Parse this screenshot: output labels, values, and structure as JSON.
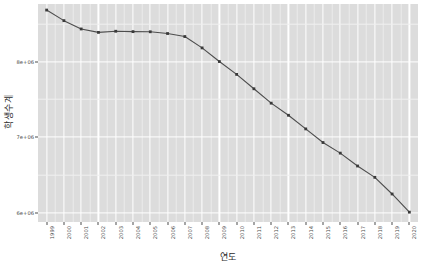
{
  "chart_data": {
    "type": "line",
    "title": "",
    "xlabel": "연도",
    "ylabel": "학생수계",
    "categories": [
      "1999",
      "2000",
      "2001",
      "2002",
      "2003",
      "2004",
      "2005",
      "2006",
      "2007",
      "2008",
      "2009",
      "2010",
      "2011",
      "2012",
      "2013",
      "2014",
      "2015",
      "2016",
      "2017",
      "2018",
      "2019",
      "2020"
    ],
    "values": [
      8680000,
      8540000,
      8430000,
      8385000,
      8400000,
      8395000,
      8393000,
      8370000,
      8330000,
      8180000,
      8000000,
      7830000,
      7640000,
      7450000,
      7290000,
      7110000,
      6930000,
      6790000,
      6620000,
      6470000,
      6250000,
      6010000
    ],
    "series": [
      {
        "name": "학생수계",
        "values": [
          8680000,
          8540000,
          8430000,
          8385000,
          8400000,
          8395000,
          8393000,
          8370000,
          8330000,
          8180000,
          8000000,
          7830000,
          7640000,
          7450000,
          7290000,
          7110000,
          6930000,
          6790000,
          6620000,
          6470000,
          6250000,
          6010000
        ]
      }
    ],
    "ytick_labels": [
      "8e+06",
      "7e+06",
      "6e+06"
    ],
    "ytick_values": [
      8000000,
      7000000,
      6000000
    ],
    "yminor_values": [
      8500000,
      7500000,
      6500000
    ],
    "ylim": [
      5880000,
      8760000
    ],
    "grid": true,
    "legend": "none",
    "line_color": "#4d4d4d",
    "point_color": "#3a3a3a",
    "panel_color": "#DCDCDC",
    "grid_color": "#ffffff"
  }
}
